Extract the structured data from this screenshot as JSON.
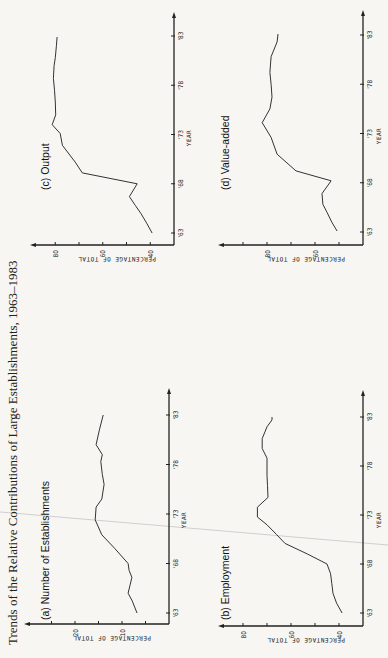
{
  "title": "Trends of the Relative Contributions of Large Establishments, 1963–1983",
  "x_axis_label": "YEAR",
  "y_axis_label": "PERCENTAGE OF TOTAL",
  "chart_data": [
    {
      "type": "line",
      "title": "(a) Number of Establishments",
      "xlabel": "YEAR",
      "ylabel": "PERCENTAGE OF TOTAL",
      "x_ticks": [
        "'63",
        "'68",
        "'73",
        "'78",
        "'83"
      ],
      "y_ticks": [
        10,
        20
      ],
      "y_minor_ticks": [
        5,
        15,
        25
      ],
      "ylim": [
        0,
        30
      ],
      "xlim": [
        1963,
        1985
      ],
      "x": [
        1963,
        1964.2,
        1965,
        1965.8,
        1966.6,
        1967.3,
        1968,
        1969.5,
        1970.9,
        1972.4,
        1973.7,
        1974.5,
        1976,
        1977,
        1978.3,
        1979,
        1980,
        1981.5,
        1983
      ],
      "values": [
        6.8,
        7.8,
        8.7,
        8.3,
        7.9,
        8.5,
        8.7,
        11.5,
        14.3,
        15.7,
        15.5,
        14.3,
        13.8,
        14.2,
        14.5,
        14.2,
        15.5,
        14.8,
        14.0
      ],
      "grid": false
    },
    {
      "type": "line",
      "title": "(b) Employment",
      "xlabel": "YEAR",
      "ylabel": "PERCENTAGE OF TOTAL",
      "x_ticks": [
        "'63",
        "'68",
        "'73",
        "'78",
        "'83"
      ],
      "y_ticks": [
        40,
        60,
        80
      ],
      "y_minor_ticks": [
        50,
        70
      ],
      "ylim": [
        30,
        90
      ],
      "xlim": [
        1963,
        1985
      ],
      "x": [
        1963,
        1964,
        1965,
        1966,
        1967,
        1968,
        1969,
        1970.1,
        1971,
        1972,
        1972.8,
        1973.8,
        1974.8,
        1976,
        1977,
        1978.8,
        1979.8,
        1980.8,
        1982,
        1982.7,
        1983
      ],
      "values": [
        38.7,
        41.0,
        42.5,
        43.0,
        43.5,
        45.0,
        53.0,
        62.5,
        66.0,
        70.0,
        74.0,
        74.0,
        69.6,
        69.8,
        70.0,
        70.0,
        72.0,
        72.0,
        70.0,
        67.9,
        67.9
      ],
      "grid": false
    },
    {
      "type": "line",
      "title": "(c) Output",
      "xlabel": "YEAR",
      "ylabel": "PERCENTAGE OF TOTAL",
      "x_ticks": [
        "'63",
        "'68",
        "'73",
        "'78",
        "'83"
      ],
      "y_ticks": [
        40,
        60,
        80
      ],
      "y_minor_ticks": [
        50,
        70
      ],
      "ylim": [
        30,
        90
      ],
      "xlim": [
        1963,
        1985
      ],
      "x": [
        1963,
        1964,
        1965,
        1965.8,
        1966.7,
        1968,
        1969.1,
        1970.2,
        1971.9,
        1973.1,
        1974,
        1975,
        1976.3,
        1977.5,
        1978.7,
        1980,
        1980.8,
        1982,
        1982.9
      ],
      "values": [
        39.2,
        41.5,
        44.0,
        46.3,
        48.8,
        45.5,
        68.6,
        71.6,
        77.0,
        77.9,
        81.3,
        79.8,
        80.0,
        80.3,
        80.8,
        80.5,
        80.0,
        79.5,
        79.2
      ],
      "grid": false
    },
    {
      "type": "line",
      "title": "(d) Value-added",
      "xlabel": "YEAR",
      "ylabel": "PERCENTAGE OF TOTAL",
      "x_ticks": [
        "'63",
        "'68",
        "'73",
        "'78",
        "'83"
      ],
      "y_ticks": [
        60,
        80
      ],
      "y_minor_ticks": [
        50,
        70,
        90
      ],
      "ylim": [
        40,
        95
      ],
      "xlim": [
        1963,
        1985
      ],
      "x": [
        1963.1,
        1964,
        1965,
        1965.8,
        1966.9,
        1968.2,
        1969.2,
        1970.9,
        1972.6,
        1974.1,
        1975.5,
        1976.7,
        1978,
        1979.2,
        1980.8,
        1982.3,
        1983.1
      ],
      "values": [
        50.8,
        53.0,
        55.0,
        56.7,
        57.1,
        53.3,
        67.9,
        75.8,
        78.3,
        82.0,
        78.8,
        77.9,
        78.3,
        78.8,
        78.3,
        75.8,
        75.4
      ],
      "grid": false
    }
  ]
}
